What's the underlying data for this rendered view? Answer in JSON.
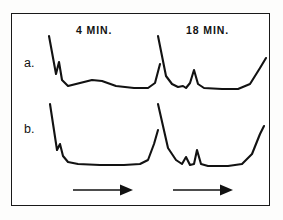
{
  "figure": {
    "background_color": "#ffffff",
    "ink_color": "#121212",
    "border_color": "#191919"
  },
  "column_headers": [
    {
      "label": "4 MIN.",
      "name": "column-header-4-min"
    },
    {
      "label": "18 MIN.",
      "name": "column-header-18-min"
    }
  ],
  "row_labels": [
    {
      "label": "a.",
      "name": "row-label-a"
    },
    {
      "label": "b.",
      "name": "row-label-b"
    }
  ],
  "arrows": [
    {
      "name": "flow-direction-arrow-left",
      "direction": "right"
    },
    {
      "name": "flow-direction-arrow-right",
      "direction": "right"
    }
  ],
  "chart_data": {
    "type": "line",
    "title": "",
    "xlabel": "",
    "ylabel": "",
    "grid": false,
    "legend_position": "none",
    "panels": [
      {
        "row": "a.",
        "column": "4 MIN.",
        "name": "trace-a-left",
        "path": "M 5 2 L 12 40 L 15 28 L 18 46 L 24 52 L 36 49 L 48 46 L 58 47 L 72 52 L 90 54 L 104 54 L 111 49 L 116 30",
        "viewbox": "0 0 116 70",
        "peaks": [
          {
            "label": "solvent front",
            "x": 12,
            "height": 38,
            "shape": "tall-sharp-descending"
          },
          {
            "label": "minor spike",
            "x": 15,
            "height": 18,
            "shape": "small-sharp"
          },
          {
            "label": "broad hump",
            "x": 50,
            "height": 6,
            "shape": "broad-low"
          },
          {
            "label": "terminal rise",
            "x": 114,
            "height": 24,
            "shape": "rising-edge"
          }
        ],
        "baseline_y": 53
      },
      {
        "row": "a.",
        "column": "18 MIN.",
        "name": "trace-a-right",
        "path": "M 8 2 L 16 42 L 22 50 L 28 53 L 33 52 L 36 54 L 40 49 L 44 36 L 48 50 L 54 54 L 72 55 L 88 55 L 100 50 L 110 34 L 116 24",
        "viewbox": "0 0 116 70",
        "peaks": [
          {
            "label": "solvent front",
            "x": 16,
            "height": 40,
            "shape": "tall-sharp-descending"
          },
          {
            "label": "small bump",
            "x": 36,
            "height": 6,
            "shape": "small-rounded"
          },
          {
            "label": "resolved peak",
            "x": 44,
            "height": 19,
            "shape": "sharp"
          },
          {
            "label": "terminal rise",
            "x": 113,
            "height": 30,
            "shape": "rising-edge"
          }
        ],
        "baseline_y": 54
      },
      {
        "row": "b.",
        "column": "4 MIN.",
        "name": "trace-b-left",
        "path": "M 6 4 L 13 50 L 16 44 L 19 56 L 24 62 L 34 64 L 56 65 L 80 65 L 96 64 L 104 60 L 110 44 L 114 30",
        "viewbox": "0 0 116 70",
        "peaks": [
          {
            "label": "solvent front",
            "x": 13,
            "height": 46,
            "shape": "tall-sharp-descending"
          },
          {
            "label": "minor spike",
            "x": 16,
            "height": 12,
            "shape": "small-sharp"
          },
          {
            "label": "terminal rise",
            "x": 113,
            "height": 35,
            "shape": "rising-edge"
          }
        ],
        "baseline_y": 65
      },
      {
        "row": "b.",
        "column": "18 MIN.",
        "name": "trace-b-right",
        "path": "M 8 4 L 18 48 L 26 60 L 32 64 L 36 57 L 40 65 L 44 64 L 47 50 L 51 64 L 58 66 L 78 66 L 92 64 L 102 54 L 110 34 L 114 26",
        "viewbox": "0 0 116 70",
        "peaks": [
          {
            "label": "solvent front",
            "x": 18,
            "height": 44,
            "shape": "tall-sharp-descending"
          },
          {
            "label": "small peak 1",
            "x": 36,
            "height": 8,
            "shape": "small-sharp"
          },
          {
            "label": "small peak 2",
            "x": 47,
            "height": 15,
            "shape": "sharp"
          },
          {
            "label": "terminal rise",
            "x": 113,
            "height": 40,
            "shape": "rising-edge"
          }
        ],
        "baseline_y": 65
      }
    ]
  }
}
